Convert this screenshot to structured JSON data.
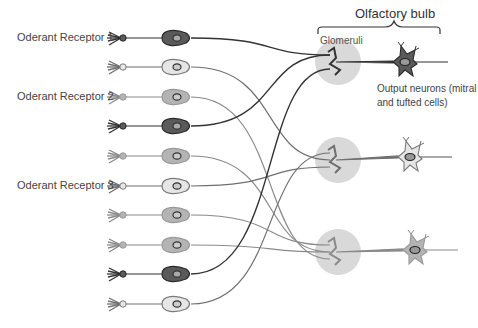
{
  "title": "Olfactory bulb",
  "glomeruli_label": "Glomeruli",
  "output_label": "Output neurons (mitral and tufted cells)",
  "receptor_labels": [
    {
      "text": "Oderant Receptor 1",
      "y": 38
    },
    {
      "text": "Oderant Receptor 2",
      "y": 97
    },
    {
      "text": "Oderant Receptor 3",
      "y": 186
    }
  ],
  "colors": {
    "dark": {
      "fill": "#5a5a5a",
      "stroke": "#2a2a2a",
      "axon": "#333333"
    },
    "light": {
      "fill": "#e6e6e6",
      "stroke": "#7a7a7a",
      "axon": "#6f6f6f"
    },
    "medium": {
      "fill": "#b4b4b4",
      "stroke": "#999999",
      "axon": "#8a8a8a"
    },
    "glomerulus_halo": "#d9d9d9"
  },
  "sensory_neurons": [
    {
      "y": 38,
      "type": "dark"
    },
    {
      "y": 67,
      "type": "light"
    },
    {
      "y": 97,
      "type": "medium"
    },
    {
      "y": 126,
      "type": "dark"
    },
    {
      "y": 156,
      "type": "medium"
    },
    {
      "y": 186,
      "type": "light"
    },
    {
      "y": 215,
      "type": "medium"
    },
    {
      "y": 245,
      "type": "medium"
    },
    {
      "y": 274,
      "type": "dark"
    },
    {
      "y": 304,
      "type": "light"
    }
  ],
  "glomeruli": [
    {
      "type": "dark",
      "x": 338,
      "y": 62
    },
    {
      "type": "light",
      "x": 338,
      "y": 160
    },
    {
      "type": "medium",
      "x": 338,
      "y": 252
    }
  ],
  "output_neurons": [
    {
      "type": "dark",
      "x": 405,
      "y": 62,
      "axon_end": 448
    },
    {
      "type": "light",
      "x": 410,
      "y": 157,
      "axon_end": 452
    },
    {
      "type": "medium",
      "x": 415,
      "y": 250,
      "axon_end": 458
    }
  ]
}
